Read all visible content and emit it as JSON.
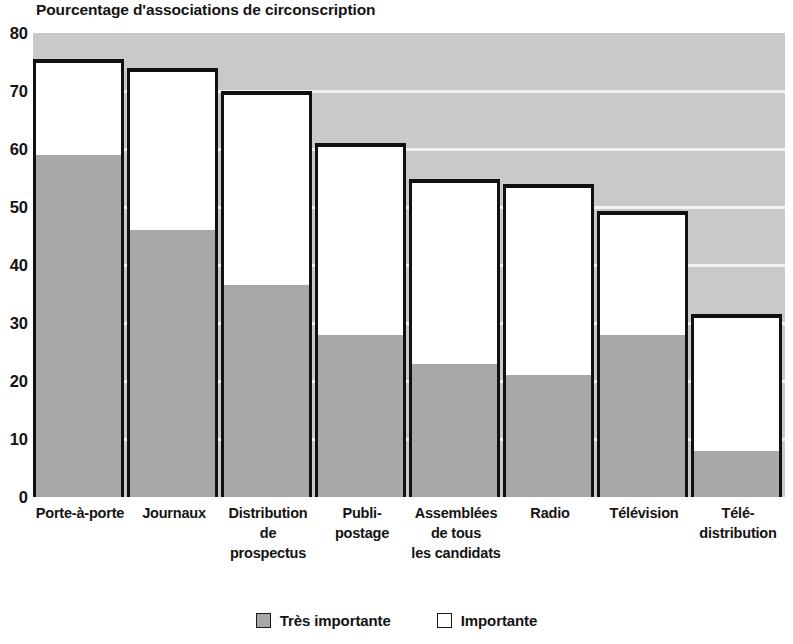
{
  "chart_data": {
    "type": "bar",
    "title": "Pourcentage d'associations de circonscription",
    "xlabel": "",
    "ylabel": "",
    "ylim": [
      0,
      80
    ],
    "ytick_step": 10,
    "yticks": [
      "80",
      "70",
      "60",
      "50",
      "40",
      "30",
      "20",
      "10",
      "0"
    ],
    "grid": true,
    "stacked": true,
    "legend_position": "bottom",
    "categories": [
      "Porte-à-porte",
      "Journaux",
      "Distribution de prospectus",
      "Publi-postage",
      "Assemblées de tous les candidats",
      "Radio",
      "Télévision",
      "Télé-distribution"
    ],
    "category_lines": [
      [
        "Porte-à-porte"
      ],
      [
        "Journaux"
      ],
      [
        "Distribution",
        "de prospectus"
      ],
      [
        "Publi-",
        "postage"
      ],
      [
        "Assemblées",
        "de tous",
        "les candidats"
      ],
      [
        "Radio"
      ],
      [
        "Télévision"
      ],
      [
        "Télé-",
        "distribution"
      ]
    ],
    "series": [
      {
        "name": "Très importante",
        "color": "#a8a8a8",
        "values": [
          59,
          46,
          36.5,
          28,
          23,
          21,
          28,
          8
        ]
      },
      {
        "name": "Importante",
        "color": "#ffffff",
        "values": [
          16.5,
          28,
          33.5,
          33,
          31.8,
          33,
          21.3,
          23.5
        ]
      }
    ],
    "totals": [
      75.5,
      74,
      70,
      61,
      54.8,
      54,
      49.3,
      31.5
    ]
  },
  "legend": {
    "items": [
      {
        "label": "Très importante",
        "swatch": "gray"
      },
      {
        "label": "Importante",
        "swatch": "white"
      }
    ]
  },
  "colors": {
    "plot_background": "#c9c9c9",
    "gridline": "#f2f2f2",
    "bar_outline": "#111111",
    "series_tres_importante": "#a8a8a8",
    "series_importante": "#ffffff",
    "text": "#131313"
  }
}
